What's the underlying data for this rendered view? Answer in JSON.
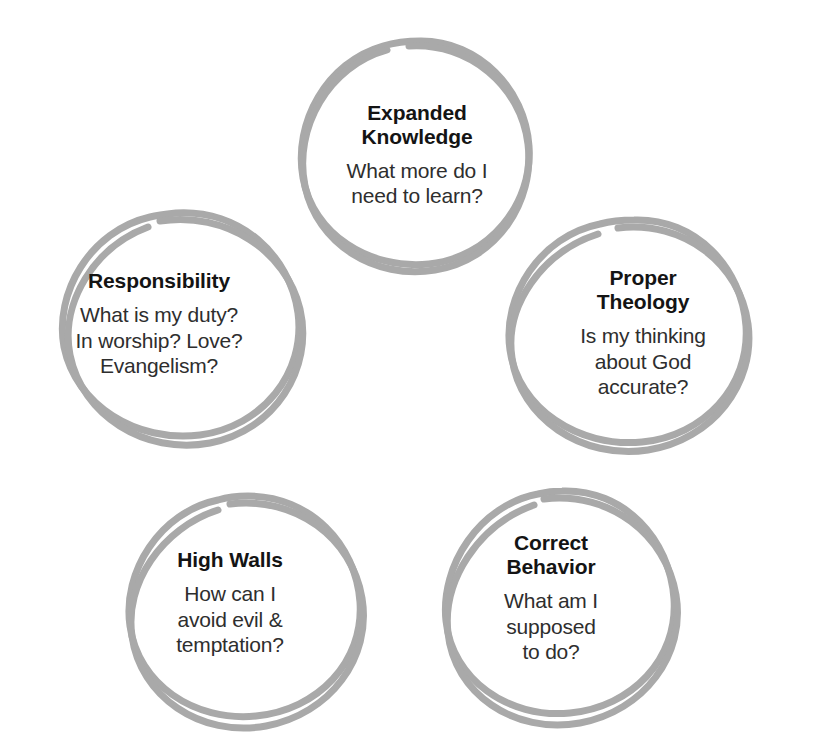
{
  "diagram": {
    "type": "cluster-of-circles",
    "background_color": "#ffffff",
    "stroke_color": "#a9a9a9",
    "title_color": "#141414",
    "body_color": "#2e2e2e",
    "bubbles": [
      {
        "id": "expanded-knowledge",
        "title": "Expanded\nKnowledge",
        "body": "What more do I\nneed to learn?",
        "position": "top"
      },
      {
        "id": "responsibility",
        "title": "Responsibility",
        "body": "What is my duty?\nIn worship? Love?\nEvangelism?",
        "position": "middle-left"
      },
      {
        "id": "proper-theology",
        "title": "Proper\nTheology",
        "body": "Is my thinking\nabout God\naccurate?",
        "position": "middle-right"
      },
      {
        "id": "high-walls",
        "title": "High Walls",
        "body": "How can I\navoid evil &\ntemptation?",
        "position": "bottom-left"
      },
      {
        "id": "correct-behavior",
        "title": "Correct\nBehavior",
        "body": "What am I\nsupposed\nto do?",
        "position": "bottom-right"
      }
    ]
  }
}
